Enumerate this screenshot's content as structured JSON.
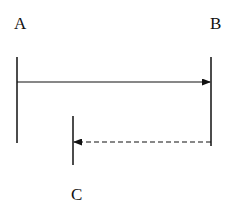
{
  "diagram": {
    "nodes": [
      {
        "id": "A",
        "label": "A"
      },
      {
        "id": "B",
        "label": "B"
      },
      {
        "id": "C",
        "label": "C"
      }
    ],
    "edges": [
      {
        "from": "A",
        "to": "B",
        "style": "solid",
        "arrow": "end"
      },
      {
        "from": "B",
        "to": "C",
        "style": "dashed",
        "arrow": "end"
      }
    ],
    "colors": {
      "line": "#111111",
      "background": "#ffffff"
    }
  }
}
